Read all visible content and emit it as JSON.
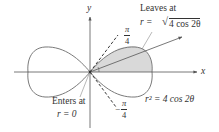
{
  "diagram": {
    "type": "polar-curve",
    "curve_equation": "r² = 4 cos 2θ",
    "curve_name": "lemniscate",
    "axes": {
      "x_label": "x",
      "y_label": "y"
    },
    "labels": {
      "leaves_line1": "Leaves at",
      "leaves_line2_prefix": "r = ",
      "leaves_line2_radicand": "4 cos 2θ",
      "enters_line1": "Enters at",
      "enters_line2": "r = 0",
      "curve_label": "r² = 4 cos 2θ",
      "angle_upper_num": "π",
      "angle_upper_den": "4",
      "angle_lower_sign": "−",
      "angle_lower_num": "π",
      "angle_lower_den": "4"
    },
    "shaded_region": "right lobe, upper half (0 ≤ θ ≤ π/4)",
    "colors": {
      "curve": "#7a7a7a",
      "shade": "#d9d9d9",
      "axis": "#555555",
      "ray": "#555555",
      "text": "#333333"
    }
  }
}
